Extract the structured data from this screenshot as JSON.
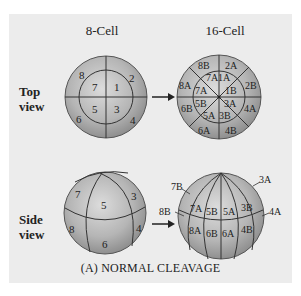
{
  "figure": {
    "columns": {
      "left": "8-Cell",
      "right": "16-Cell"
    },
    "rows": {
      "top": [
        "Top",
        "view"
      ],
      "side": [
        "Side",
        "view"
      ]
    },
    "caption": "(A)  NORMAL CLEAVAGE",
    "colors": {
      "panel": "#ececec",
      "sphere_light": "#d9d9d9",
      "sphere_dark": "#8a8a8a",
      "line": "#333333"
    }
  },
  "top_8cell": {
    "outer": [
      "8",
      "2",
      "6",
      "4"
    ],
    "inner": [
      "7",
      "1",
      "5",
      "3"
    ]
  },
  "top_16cell": {
    "outer": [
      "8B",
      "2A",
      "2B",
      "4A",
      "4B",
      "6A",
      "6B",
      "8A"
    ],
    "inner": [
      "7A",
      "1A",
      "1B",
      "3A",
      "3B",
      "5A",
      "5B",
      "7A"
    ]
  },
  "side_8cell": {
    "labels": [
      "7",
      "5",
      "3",
      "8",
      "6",
      "4"
    ]
  },
  "side_16cell": {
    "inner": [
      "7A",
      "5B",
      "5A",
      "3B",
      "8A",
      "6B",
      "6A",
      "4B"
    ],
    "callouts": [
      "7B",
      "8B",
      "3A",
      "4A"
    ]
  }
}
